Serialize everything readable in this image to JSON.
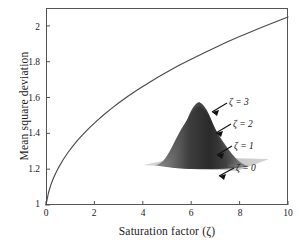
{
  "chart_data": {
    "type": "line",
    "title": "",
    "xlabel": "Saturation factor (ζ)",
    "ylabel": "Mean square deviation",
    "xlim": [
      0,
      10
    ],
    "ylim": [
      1,
      2.1
    ],
    "xticks": [
      "0",
      "2",
      "4",
      "6",
      "8",
      "10"
    ],
    "xtick_values": [
      0,
      2,
      4,
      6,
      8,
      10
    ],
    "yticks": [
      "1",
      "1.2",
      "1.4",
      "1.6",
      "1.8",
      "2"
    ],
    "ytick_values": [
      1,
      1.2,
      1.4,
      1.6,
      1.8,
      2
    ],
    "grid": false,
    "legend": "none",
    "series": [
      {
        "name": "Mean square deviation",
        "x": [
          0,
          0.1,
          0.2,
          0.3,
          0.4,
          0.5,
          0.7,
          0.9,
          1.1,
          1.3,
          1.5,
          1.8,
          2.1,
          2.4,
          2.7,
          3.0,
          3.4,
          3.8,
          4.2,
          4.6,
          5.0,
          5.5,
          6.0,
          6.5,
          7.0,
          7.5,
          8.0,
          8.5,
          9.0,
          9.5,
          10
        ],
        "y": [
          1.0,
          1.043,
          1.072,
          1.095,
          1.114,
          1.131,
          1.161,
          1.187,
          1.21,
          1.231,
          1.25,
          1.277,
          1.301,
          1.324,
          1.345,
          1.365,
          1.39,
          1.413,
          1.435,
          1.456,
          1.476,
          1.5,
          1.522,
          1.543,
          1.564,
          1.584,
          1.603,
          1.621,
          1.639,
          1.656,
          1.673
        ]
      }
    ],
    "curve_endpoints": {
      "start": [
        0,
        1.0
      ],
      "end": [
        10,
        2.05
      ]
    },
    "inset": {
      "type": "surface-3d",
      "description": "nested bell-shaped surfaces",
      "annotations": [
        {
          "label": "ζ = 3"
        },
        {
          "label": "ζ = 2"
        },
        {
          "label": "ζ = 1"
        },
        {
          "label": "ζ = 0"
        }
      ]
    }
  },
  "axes": {
    "x_title": "Saturation factor (ζ)",
    "y_title": "Mean square deviation",
    "x_tick_labels": [
      "0",
      "2",
      "4",
      "6",
      "8",
      "10"
    ],
    "y_tick_labels": [
      "1",
      "1.2",
      "1.4",
      "1.6",
      "1.8",
      "2"
    ]
  },
  "inset_labels": {
    "zeta3": "ζ = 3",
    "zeta2": "ζ = 2",
    "zeta1": "ζ = 1",
    "zeta0": "ζ = 0"
  },
  "colors": {
    "curve": "#4a4a4a",
    "axis": "#555555",
    "text": "#1a1a1a",
    "surface_dark": "#3a3a3a",
    "surface_light": "#bdbdbd",
    "base_plane": "#c9c9c9"
  }
}
